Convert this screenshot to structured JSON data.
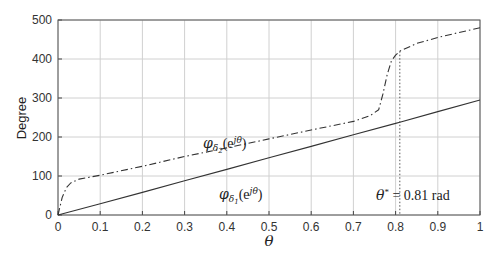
{
  "chart_data": {
    "type": "line",
    "title": "",
    "xlabel": "θ",
    "ylabel": "Degree",
    "xlim": [
      0,
      1
    ],
    "ylim": [
      0,
      500
    ],
    "grid": true,
    "legend": "none",
    "x_ticks": [
      "0",
      "0.1",
      "0.2",
      "0.3",
      "0.4",
      "0.5",
      "0.6",
      "0.7",
      "0.8",
      "0.9",
      "1"
    ],
    "y_ticks": [
      "0",
      "100",
      "200",
      "300",
      "400",
      "500"
    ],
    "series": [
      {
        "name": "phi_delta1(e^{jθ})",
        "style": "solid",
        "x": [
          0,
          0.1,
          0.2,
          0.3,
          0.4,
          0.5,
          0.6,
          0.7,
          0.8,
          0.81,
          0.9,
          1.0
        ],
        "values": [
          0,
          29,
          58,
          88,
          117,
          147,
          176,
          206,
          235,
          238,
          265,
          295
        ]
      },
      {
        "name": "phi_delta2(e^{jθ})",
        "style": "dashdot",
        "x": [
          0,
          0.01,
          0.02,
          0.03,
          0.05,
          0.1,
          0.2,
          0.3,
          0.4,
          0.5,
          0.6,
          0.7,
          0.74,
          0.76,
          0.77,
          0.78,
          0.79,
          0.8,
          0.81,
          0.85,
          0.9,
          0.95,
          1.0
        ],
        "values": [
          0,
          45,
          70,
          82,
          92,
          102,
          125,
          150,
          172,
          195,
          218,
          240,
          255,
          270,
          310,
          360,
          395,
          410,
          420,
          440,
          455,
          468,
          480
        ]
      }
    ],
    "annotations": [
      {
        "text": "φ_{δ2}(e^{jθ})",
        "x": 0.31,
        "y": 185
      },
      {
        "text": "φ_{δ1}(e^{jθ})",
        "x": 0.31,
        "y": 48
      },
      {
        "text": "θ* = 0.81 rad",
        "x": 0.86,
        "y": 40
      },
      {
        "text": "vertical dotted line at θ* = 0.81",
        "x": 0.81
      }
    ],
    "theta_star": 0.81
  },
  "labels": {
    "ylabel": "Degree",
    "xlabel": "θ",
    "phi2_main": "φ",
    "phi2_sub": "δ",
    "phi2_subsub": "2",
    "phi2_arg": "(e",
    "phi2_exp": "jθ",
    "phi2_close": ")",
    "phi1_main": "φ",
    "phi1_sub": "δ",
    "phi1_subsub": "1",
    "phi1_arg": "(e",
    "phi1_exp": "jθ",
    "phi1_close": ")",
    "theta_star_sym": "θ",
    "theta_star_sup": "*",
    "theta_star_value": " = 0.81 rad"
  }
}
